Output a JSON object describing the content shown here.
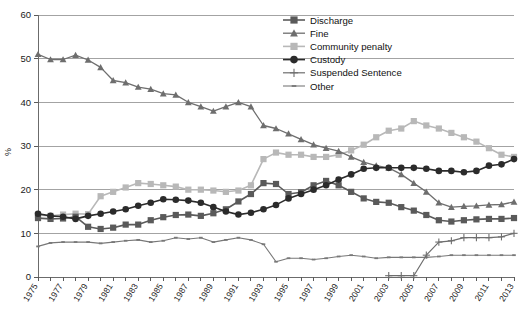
{
  "chart_data": {
    "type": "line",
    "title": "",
    "xlabel": "",
    "ylabel": "%",
    "ylim": [
      0,
      60
    ],
    "ytick_step": 10,
    "yticks": [
      "0",
      "10",
      "20",
      "30",
      "40",
      "50",
      "60"
    ],
    "grid": "horizontal",
    "legend_position": "top-center",
    "x": [
      1975,
      1976,
      1977,
      1978,
      1979,
      1980,
      1981,
      1982,
      1983,
      1984,
      1985,
      1986,
      1987,
      1988,
      1989,
      1990,
      1991,
      1992,
      1993,
      1994,
      1995,
      1996,
      1997,
      1998,
      1999,
      2000,
      2001,
      2002,
      2003,
      2004,
      2005,
      2006,
      2007,
      2008,
      2009,
      2010,
      2011,
      2012,
      2013
    ],
    "xticks": [
      "1975",
      "1977",
      "1979",
      "1981",
      "1983",
      "1985",
      "1987",
      "1989",
      "1991",
      "1993",
      "1995",
      "1997",
      "1999",
      "2001",
      "2003",
      "2005",
      "2007",
      "2009",
      "2011",
      "2013"
    ],
    "series": [
      {
        "name": "Discharge",
        "color": "#5a5a5a",
        "marker": "square",
        "values": [
          13.5,
          13.3,
          13.4,
          13.8,
          11.5,
          11.0,
          11.3,
          12.0,
          12.0,
          13.0,
          13.7,
          14.2,
          14.3,
          14.0,
          14.6,
          15.5,
          17.3,
          19.0,
          21.5,
          21.3,
          19.0,
          19.4,
          21.0,
          22.0,
          21.0,
          19.5,
          18.0,
          17.2,
          17.0,
          16.0,
          15.2,
          14.2,
          13.0,
          12.7,
          13.0,
          13.2,
          13.3,
          13.3,
          13.5
        ]
      },
      {
        "name": "Fine",
        "color": "#6e6e6e",
        "marker": "triangle",
        "values": [
          51.0,
          49.8,
          49.8,
          50.8,
          49.7,
          48.0,
          45.0,
          44.5,
          43.5,
          43.0,
          42.0,
          41.7,
          40.0,
          39.0,
          38.0,
          39.0,
          40.0,
          39.0,
          34.7,
          34.0,
          32.8,
          31.5,
          30.3,
          29.5,
          28.8,
          27.5,
          26.3,
          25.5,
          25.0,
          23.5,
          21.5,
          19.5,
          17.0,
          16.0,
          16.2,
          16.3,
          16.5,
          16.6,
          17.2
        ]
      },
      {
        "name": "Community penalty",
        "color": "#b8b8b8",
        "marker": "square",
        "values": [
          14.2,
          14.0,
          14.3,
          14.5,
          14.4,
          18.5,
          19.5,
          20.5,
          21.5,
          21.3,
          21.0,
          20.7,
          20.0,
          20.0,
          19.8,
          19.5,
          19.8,
          21.0,
          27.0,
          28.5,
          28.0,
          28.0,
          27.5,
          27.5,
          28.0,
          29.0,
          30.3,
          32.0,
          33.5,
          34.0,
          35.7,
          34.7,
          34.0,
          33.0,
          32.0,
          31.0,
          29.5,
          28.0,
          27.5
        ]
      },
      {
        "name": "Custody",
        "color": "#2b2b2b",
        "marker": "circle",
        "values": [
          14.5,
          14.0,
          13.8,
          13.3,
          14.0,
          14.5,
          15.0,
          15.5,
          16.3,
          17.0,
          17.8,
          17.7,
          17.5,
          17.0,
          16.0,
          15.0,
          14.3,
          14.7,
          15.5,
          16.5,
          18.0,
          19.0,
          20.0,
          21.0,
          22.3,
          23.5,
          24.8,
          25.0,
          25.0,
          25.0,
          25.0,
          24.8,
          24.3,
          24.3,
          24.0,
          24.3,
          25.5,
          25.8,
          27.0
        ]
      },
      {
        "name": "Suspended Sentence",
        "color": "#6e6e6e",
        "marker": "plus",
        "values": [
          null,
          null,
          null,
          null,
          null,
          null,
          null,
          null,
          null,
          null,
          null,
          null,
          null,
          null,
          null,
          null,
          null,
          null,
          null,
          null,
          null,
          null,
          null,
          null,
          null,
          null,
          null,
          null,
          0.3,
          0.3,
          0.3,
          5.0,
          8.0,
          8.3,
          9.0,
          9.0,
          9.0,
          9.2,
          10.0
        ]
      },
      {
        "name": "Other",
        "color": "#787878",
        "marker": "dash",
        "values": [
          7.0,
          7.8,
          8.0,
          8.0,
          8.0,
          7.7,
          8.0,
          8.3,
          8.5,
          8.0,
          8.3,
          9.0,
          8.7,
          9.0,
          8.0,
          8.5,
          9.0,
          8.5,
          7.5,
          3.5,
          4.3,
          4.3,
          4.0,
          4.3,
          4.7,
          5.0,
          4.7,
          4.3,
          4.5,
          4.5,
          4.5,
          4.5,
          4.7,
          5.0,
          5.0,
          5.0,
          5.0,
          5.0,
          5.0
        ]
      }
    ]
  },
  "legend": {
    "entries": [
      {
        "label": "Discharge"
      },
      {
        "label": "Fine"
      },
      {
        "label": "Community penalty"
      },
      {
        "label": "Custody"
      },
      {
        "label": "Suspended Sentence"
      },
      {
        "label": "Other"
      }
    ]
  }
}
